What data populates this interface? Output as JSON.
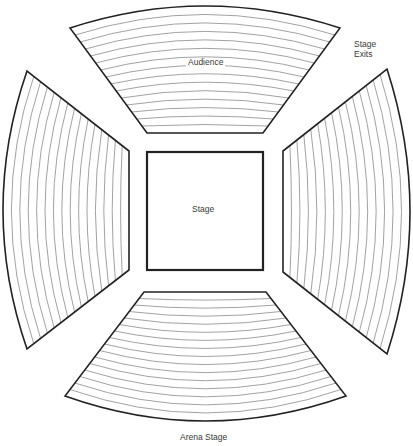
{
  "labels": {
    "audience": "Audience",
    "stage": "Stage",
    "stage_exits_line1": "Stage",
    "stage_exits_line2": "Exits",
    "caption": "Arena Stage"
  },
  "colors": {
    "outline": "#222222",
    "row_line": "#8a8a8a",
    "background": "#ffffff",
    "text": "#3a3a3a"
  },
  "stage": {
    "x": 147,
    "y": 152,
    "width": 116,
    "height": 118
  },
  "sections": [
    {
      "name": "seating-top",
      "orientation": "top",
      "inner": {
        "y": 133,
        "x1": 147,
        "x2": 263,
        "sag": 0
      },
      "outer": {
        "y": 28,
        "x1": 70,
        "x2": 340,
        "peak": 6
      },
      "rows": 15
    },
    {
      "name": "seating-bottom",
      "orientation": "bottom",
      "inner": {
        "y": 292,
        "x1": 144,
        "x2": 266,
        "sag": 0
      },
      "outer": {
        "y": 396,
        "x1": 65,
        "x2": 346,
        "peak": 421
      },
      "rows": 16
    },
    {
      "name": "seating-left",
      "orientation": "left",
      "inner": {
        "x": 129,
        "y1": 151,
        "y2": 270
      },
      "outer": {
        "x": 27,
        "y1": 71,
        "y2": 349,
        "peak": 3
      },
      "rows": 15
    },
    {
      "name": "seating-right",
      "orientation": "right",
      "inner": {
        "x": 283,
        "y1": 151,
        "y2": 272
      },
      "outer": {
        "x": 387,
        "y1": 69,
        "y2": 354,
        "peak": 410
      },
      "rows": 15
    }
  ]
}
